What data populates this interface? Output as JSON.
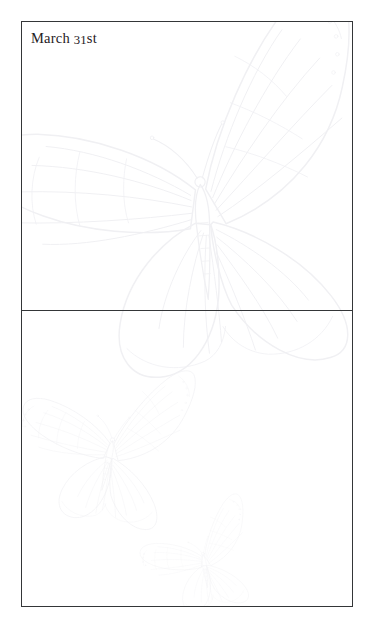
{
  "page": {
    "background_color": "#ffffff",
    "width": 376,
    "height": 634
  },
  "frame": {
    "border_color": "#343638",
    "border_width_px": 1.3,
    "x": 21,
    "y": 21,
    "width": 332,
    "height": 586
  },
  "divider": {
    "y": 310,
    "color": "#343638"
  },
  "heading": {
    "full_text": "March 31st",
    "month": "March",
    "day_number": "31",
    "day_suffix": "st",
    "color": "#1f2024"
  },
  "panels": [
    {
      "name": "top-panel",
      "label": "March 31st",
      "content": ""
    },
    {
      "name": "bottom-panel",
      "label": "",
      "content": ""
    }
  ],
  "watermarks": {
    "color": "#f2f2f5",
    "color_deep": "#ececed",
    "items": [
      {
        "name": "large-butterfly",
        "panel": "top-panel",
        "center_x": 200,
        "center_y": 205,
        "scale": 1.0
      },
      {
        "name": "medium-butterfly",
        "panel": "bottom-panel",
        "center_x": 95,
        "center_y": 450,
        "scale": 0.42
      },
      {
        "name": "small-butterfly",
        "panel": "bottom-panel",
        "center_x": 196,
        "center_y": 560,
        "scale": 0.3
      }
    ]
  }
}
